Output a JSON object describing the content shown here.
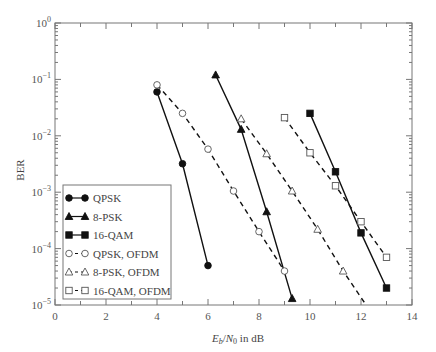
{
  "chart_data": {
    "type": "line",
    "title": "",
    "xlabel": "E_b/N_0 in dB",
    "ylabel": "BER",
    "xscale": "linear",
    "yscale": "log",
    "xlim": [
      0,
      14
    ],
    "ylim": [
      1e-05,
      1
    ],
    "x_ticks": [
      0,
      2,
      4,
      6,
      8,
      10,
      12,
      14
    ],
    "y_ticks": [
      "10^0",
      "10^-1",
      "10^-2",
      "10^-3",
      "10^-4",
      "10^-5"
    ],
    "grid": false,
    "legend_position": "lower left",
    "series": [
      {
        "name": "QPSK",
        "style": "solid",
        "marker": "filled-circle",
        "x": [
          4,
          5,
          6
        ],
        "y": [
          0.06,
          0.0032,
          5e-05
        ]
      },
      {
        "name": "8-PSK",
        "style": "solid",
        "marker": "filled-triangle",
        "x": [
          6.3,
          7.3,
          8.3,
          9.3
        ],
        "y": [
          0.12,
          0.013,
          0.00045,
          1.3e-05
        ]
      },
      {
        "name": "16-QAM",
        "style": "solid",
        "marker": "filled-square",
        "x": [
          10,
          11,
          12,
          13
        ],
        "y": [
          0.025,
          0.0023,
          0.00019,
          2e-05
        ]
      },
      {
        "name": "QPSK, OFDM",
        "style": "dashed",
        "marker": "open-circle",
        "x": [
          4,
          5,
          6,
          7,
          8,
          9
        ],
        "y": [
          0.08,
          0.025,
          0.0058,
          0.00105,
          0.0002,
          4e-05
        ]
      },
      {
        "name": "8-PSK, OFDM",
        "style": "dashed",
        "marker": "open-triangle",
        "x": [
          7.3,
          8.3,
          9.3,
          10.3,
          11.3,
          12.2
        ],
        "y": [
          0.02,
          0.0048,
          0.00105,
          0.00022,
          4e-05,
          9.5e-06
        ]
      },
      {
        "name": "16-QAM, OFDM",
        "style": "dashed",
        "marker": "open-square",
        "x": [
          9,
          10,
          11,
          12,
          13
        ],
        "y": [
          0.021,
          0.005,
          0.0013,
          0.0003,
          7e-05
        ]
      }
    ]
  },
  "legend": {
    "items": [
      "QPSK",
      "8-PSK",
      "16-QAM",
      "QPSK, OFDM",
      "8-PSK, OFDM",
      "16-QAM, OFDM"
    ]
  },
  "axes": {
    "ylabel": "BER",
    "xlabel_parts": {
      "e": "E",
      "b": "b",
      "slash": "/",
      "n": "N",
      "zero": "0",
      "rest": " in dB"
    }
  },
  "colors": {
    "line": "#111111",
    "frame": "#777777",
    "text": "#444444"
  }
}
